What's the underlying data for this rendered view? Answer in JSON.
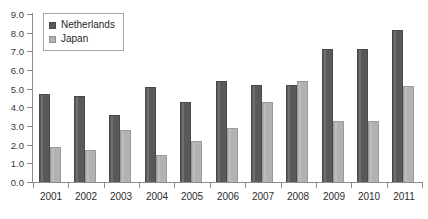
{
  "chart_data": {
    "type": "bar",
    "title": "",
    "subtitle": "",
    "xlabel": "",
    "ylabel": "",
    "categories": [
      "2001",
      "2002",
      "2003",
      "2004",
      "2005",
      "2006",
      "2007",
      "2008",
      "2009",
      "2010",
      "2011"
    ],
    "series": [
      {
        "name": "Netherlands",
        "color": "#595959",
        "values": [
          4.7,
          4.6,
          3.6,
          5.1,
          4.3,
          5.4,
          5.2,
          5.2,
          7.15,
          7.15,
          8.15
        ]
      },
      {
        "name": "Japan",
        "color": "#b2b2b2",
        "values": [
          1.9,
          1.7,
          2.8,
          1.45,
          2.2,
          2.9,
          4.3,
          5.4,
          3.25,
          3.25,
          5.15
        ]
      }
    ],
    "ylim": [
      0.0,
      9.0
    ],
    "ytick_step": 1.0,
    "ytick_labels": [
      "9.0",
      "8.0",
      "7.0",
      "6.0",
      "5.0",
      "4.0",
      "3.0",
      "2.0",
      "1.0",
      "0.0"
    ],
    "ytick_values": [
      9.0,
      8.0,
      7.0,
      6.0,
      5.0,
      4.0,
      3.0,
      2.0,
      1.0,
      0.0
    ],
    "grid": false,
    "legend_position": "top-left",
    "legend_entries": [
      "Netherlands",
      "Japan"
    ],
    "annotations": []
  }
}
